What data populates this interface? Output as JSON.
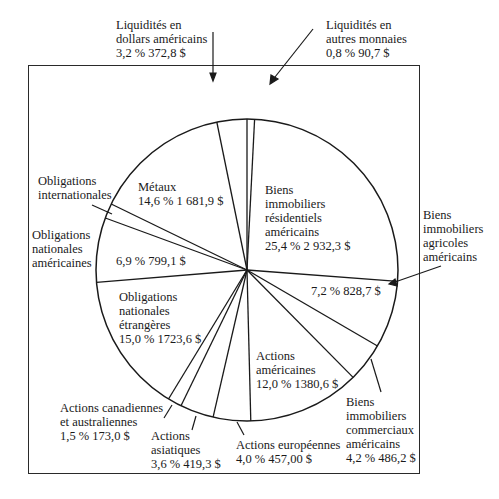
{
  "chart_data": {
    "type": "pie",
    "title": "",
    "start_angle_deg": 0,
    "direction": "clockwise",
    "slices": [
      {
        "label": "Liquidités en autres monnaies",
        "percent": 0.8,
        "value": 90.7,
        "pct_text": "0,8 %",
        "value_text": "90,7 $"
      },
      {
        "label": "Biens immobiliers résidentiels américains",
        "percent": 25.4,
        "value": 2932.3,
        "pct_text": "25,4 %",
        "value_text": "2 932,3 $"
      },
      {
        "label": "Biens immobiliers agricoles américains",
        "percent": 7.2,
        "value": 828.7,
        "pct_text": "7,2 %",
        "value_text": "828,7 $"
      },
      {
        "label": "Biens immobiliers commerciaux américains",
        "percent": 4.2,
        "value": 486.2,
        "pct_text": "4,2 %",
        "value_text": "486,2 $"
      },
      {
        "label": "Actions américaines",
        "percent": 12.0,
        "value": 1380.6,
        "pct_text": "12,0 %",
        "value_text": "1380,6 $"
      },
      {
        "label": "Actions européennes",
        "percent": 4.0,
        "value": 457.0,
        "pct_text": "4,0 %",
        "value_text": "457,00 $"
      },
      {
        "label": "Actions asiatiques",
        "percent": 3.6,
        "value": 419.3,
        "pct_text": "3,6 %",
        "value_text": "419,3 $"
      },
      {
        "label": "Actions canadiennes et australiennes",
        "percent": 1.5,
        "value": 173.0,
        "pct_text": "1,5 %",
        "value_text": "173,0 $"
      },
      {
        "label": "Obligations nationales étrangères",
        "percent": 15.0,
        "value": 1723.6,
        "pct_text": "15,0 %",
        "value_text": "1723,6 $"
      },
      {
        "label": "Obligations nationales américaines",
        "percent": 6.9,
        "value": 799.1,
        "pct_text": "6,9 %",
        "value_text": "799,1 $"
      },
      {
        "label": "Obligations internationales",
        "percent": 1.6,
        "value": null,
        "pct_text": "",
        "value_text": ""
      },
      {
        "label": "Métaux",
        "percent": 14.6,
        "value": 1681.9,
        "pct_text": "14,6 %",
        "value_text": "1 681,9 $"
      },
      {
        "label": "Liquidités en dollars américains",
        "percent": 3.2,
        "value": 372.8,
        "pct_text": "3,2 %",
        "value_text": "372,8 $"
      }
    ],
    "legend": "none (callout labels)",
    "units": "percent and dollars"
  },
  "labels": {
    "liq_usd": {
      "line1": "Liquidités en",
      "line2": "dollars américains",
      "line3": "3,2 %  372,8 $"
    },
    "liq_other": {
      "line1": "Liquidités en",
      "line2": "autres monnaies",
      "line3": "0,8 %  90,7 $"
    },
    "metaux": {
      "line1": "Métaux",
      "line2": "14,6 %  1 681,9 $"
    },
    "oblig_intl": {
      "line1": "Obligations",
      "line2": "internationales"
    },
    "oblig_us": {
      "line1": "Obligations",
      "line2": "nationales",
      "line3": "américaines"
    },
    "oblig_us_val": "6,9 %  799,1 $",
    "resid": {
      "line1": "Biens",
      "line2": "immobiliers",
      "line3": "résidentiels",
      "line4": "américains",
      "line5": "25,4 %  2 932,3 $"
    },
    "agri": {
      "line1": "Biens",
      "line2": "immobiliers",
      "line3": "agricoles",
      "line4": "américains"
    },
    "agri_val": "7,2 %  828,7 $",
    "oblig_etr": {
      "line1": "Obligations",
      "line2": "nationales",
      "line3": "étrangères",
      "line4": "15,0 %  1723,6 $"
    },
    "act_us": {
      "line1": "Actions",
      "line2": "américaines",
      "line3": "12,0 %  1380,6 $"
    },
    "comm": {
      "line1": "Biens",
      "line2": "immobiliers",
      "line3": "commerciaux",
      "line4": "américains",
      "line5": "4,2 %  486,2 $"
    },
    "act_can": {
      "line1": "Actions canadiennes",
      "line2": "et australiennes",
      "line3": "1,5 %  173,0 $"
    },
    "act_asia": {
      "line1": "Actions",
      "line2": "asiatiques",
      "line3": "3,6 %  419,3 $"
    },
    "act_eur": {
      "line1": "Actions européennes",
      "line2": "4,0 %  457,00 $"
    }
  },
  "colors": {
    "ink": "#1a1a1a",
    "background": "#ffffff"
  }
}
